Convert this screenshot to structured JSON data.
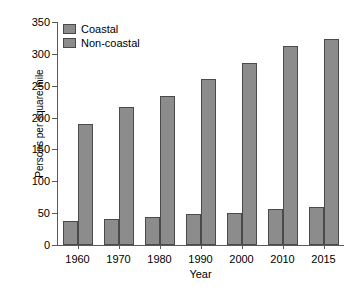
{
  "chart_data": {
    "type": "bar",
    "title": "",
    "xlabel": "Year",
    "ylabel": "Persons per square mile",
    "categories": [
      "1960",
      "1970",
      "1980",
      "1990",
      "2000",
      "2010",
      "2015"
    ],
    "series": [
      {
        "name": "Coastal",
        "values": [
          37,
          41,
          44,
          48,
          51,
          56,
          60
        ],
        "color": "#8c8c8c"
      },
      {
        "name": "Non-coastal",
        "values": [
          190,
          217,
          234,
          261,
          285,
          313,
          324
        ],
        "color": "#8c8c8c"
      }
    ],
    "ylim": [
      0,
      350
    ],
    "yticks": [
      0,
      50,
      100,
      150,
      200,
      250,
      300,
      350
    ],
    "ytick_labels": [
      "0",
      "50",
      "100",
      "150",
      "200",
      "250",
      "300",
      "350"
    ],
    "grid": false,
    "legend_position": "top-left"
  },
  "axes": {
    "y_title": "Persons per square mile",
    "x_title": "Year"
  },
  "legend": {
    "entries": [
      {
        "label": "Coastal"
      },
      {
        "label": "Non-coastal"
      }
    ]
  },
  "colors": {
    "bar_fill": "#8c8c8c",
    "bar_stroke": "#4a4a4a",
    "axis": "#5a5a5a",
    "text": "#000000",
    "background": "#ffffff"
  }
}
